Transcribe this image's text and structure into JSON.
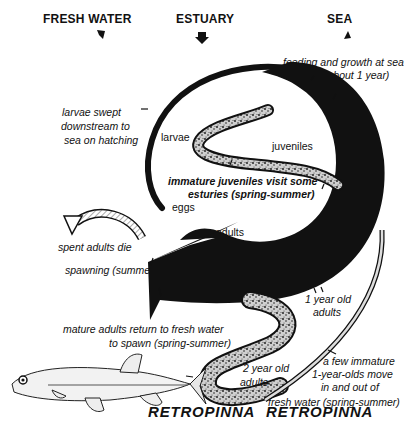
{
  "headers": {
    "fresh_water": "FRESH WATER",
    "estuary": "ESTUARY",
    "sea": "SEA"
  },
  "stage_labels": {
    "larvae": "larvae",
    "juveniles": "juveniles",
    "eggs": "eggs",
    "adults": "adults",
    "one_year_old_line1": "1 year old",
    "one_year_old_line2": "adults",
    "two_year_old_line1": "2 year old",
    "two_year_old_line2": "adults"
  },
  "annotations": {
    "feeding_line1": "feeding and growth at sea",
    "feeding_line2": "(about 1 year)",
    "larvae_swept_line1": "larvae swept",
    "larvae_swept_line2": "downstream to",
    "larvae_swept_line3": "sea on hatching",
    "immature_juv_line1": "immature juveniles visit some",
    "immature_juv_line2": "esturies (spring-summer)",
    "spent_adults": "spent adults die",
    "spawning": "spawning (summer)",
    "mature_return_line1": "mature adults return to fresh water",
    "mature_return_line2": "to spawn  (spring-summer)",
    "few_immature_line1": "a few immature",
    "few_immature_line2": "1-year-olds move",
    "few_immature_line3": "in and out of",
    "few_immature_line4": "fresh water (spring-summer)"
  },
  "species": {
    "genus": "RETROPINNA",
    "species": "RETROPINNA"
  },
  "colors": {
    "ink": "#111111",
    "speckle": "#8a8a8a",
    "paper": "#ffffff"
  }
}
